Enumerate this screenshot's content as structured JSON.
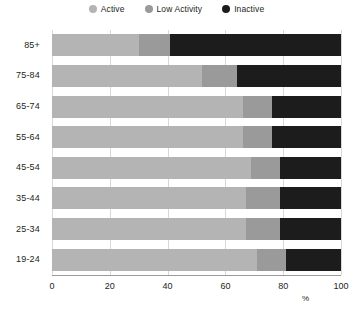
{
  "chart_data": {
    "type": "bar",
    "subtype": "stacked-horizontal-bar",
    "title": "",
    "xlabel": "%",
    "ylabel": "",
    "xlim": [
      0,
      100
    ],
    "xticks": [
      0,
      20,
      40,
      60,
      80,
      100
    ],
    "grid": true,
    "legend_position": "top-center",
    "categories": [
      "85+",
      "75-84",
      "65-74",
      "55-64",
      "45-54",
      "35-44",
      "25-34",
      "19-24"
    ],
    "series": [
      {
        "name": "Active",
        "color": "#b4b4b4",
        "values": [
          30,
          52,
          66,
          66,
          69,
          67,
          67,
          71
        ]
      },
      {
        "name": "Low Activity",
        "color": "#9a9a9a",
        "values": [
          11,
          12,
          10,
          10,
          10,
          12,
          12,
          10
        ]
      },
      {
        "name": "Inactive",
        "color": "#1c1c1c",
        "values": [
          59,
          36,
          24,
          24,
          21,
          21,
          21,
          19
        ]
      }
    ]
  },
  "legend": {
    "items": [
      {
        "label": "Active",
        "color": "#b4b4b4",
        "icon": "circle-swatch-icon"
      },
      {
        "label": "Low Activity",
        "color": "#9a9a9a",
        "icon": "circle-swatch-icon"
      },
      {
        "label": "Inactive",
        "color": "#1c1c1c",
        "icon": "circle-swatch-icon"
      }
    ]
  },
  "axes": {
    "x": {
      "unit": "%",
      "ticks": [
        "0",
        "20",
        "40",
        "60",
        "80",
        "100"
      ]
    },
    "y": {
      "ticks": [
        "85+",
        "75-84",
        "65-74",
        "55-64",
        "45-54",
        "35-44",
        "25-34",
        "19-24"
      ]
    }
  },
  "colors": {
    "active": "#b4b4b4",
    "low_activity": "#9a9a9a",
    "inactive": "#1c1c1c",
    "gridline": "#d8d8d8",
    "axis": "#9a9a9a",
    "text": "#231f20",
    "background": "#ffffff"
  }
}
